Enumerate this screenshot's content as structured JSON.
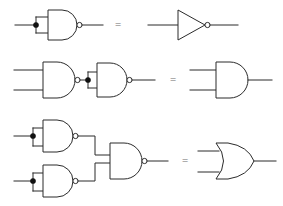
{
  "figure": {
    "background_color": "#ffffff",
    "line_color": "#2b2b2b",
    "equals_color": "#6e6e6e",
    "width": 283,
    "height": 206
  },
  "equals_signs": {
    "row1": "=",
    "row2": "=",
    "row3": "="
  },
  "rows": [
    {
      "id": "row-1",
      "identity": "NAND with inputs tied together = NOT",
      "left_side": {
        "gates": [
          {
            "name": "nand-gate",
            "type": "NAND",
            "inputs": 2,
            "inputs_tied": true,
            "has_bubble": true
          }
        ],
        "junction_dots": 1
      },
      "right_side": {
        "gates": [
          {
            "name": "not-gate",
            "type": "NOT",
            "inputs": 1,
            "inputs_tied": false,
            "has_bubble": true
          }
        ],
        "junction_dots": 0
      }
    },
    {
      "id": "row-2",
      "identity": "NAND followed by NAND inverter = AND",
      "left_side": {
        "gates": [
          {
            "name": "nand-gate-1",
            "type": "NAND",
            "inputs": 2,
            "inputs_tied": false,
            "has_bubble": true
          },
          {
            "name": "nand-gate-2",
            "type": "NAND",
            "inputs": 2,
            "inputs_tied": true,
            "has_bubble": true
          }
        ],
        "junction_dots": 1
      },
      "right_side": {
        "gates": [
          {
            "name": "and-gate",
            "type": "AND",
            "inputs": 2,
            "inputs_tied": false,
            "has_bubble": false
          }
        ],
        "junction_dots": 0
      }
    },
    {
      "id": "row-3",
      "identity": "Two NAND inverters into a NAND = OR",
      "left_side": {
        "gates": [
          {
            "name": "nand-inverter-top",
            "type": "NAND",
            "inputs": 2,
            "inputs_tied": true,
            "has_bubble": true
          },
          {
            "name": "nand-inverter-bottom",
            "type": "NAND",
            "inputs": 2,
            "inputs_tied": true,
            "has_bubble": true
          },
          {
            "name": "nand-gate-output",
            "type": "NAND",
            "inputs": 2,
            "inputs_tied": false,
            "has_bubble": true
          }
        ],
        "junction_dots": 2
      },
      "right_side": {
        "gates": [
          {
            "name": "or-gate",
            "type": "OR",
            "inputs": 2,
            "inputs_tied": false,
            "has_bubble": false
          }
        ],
        "junction_dots": 0
      }
    }
  ]
}
